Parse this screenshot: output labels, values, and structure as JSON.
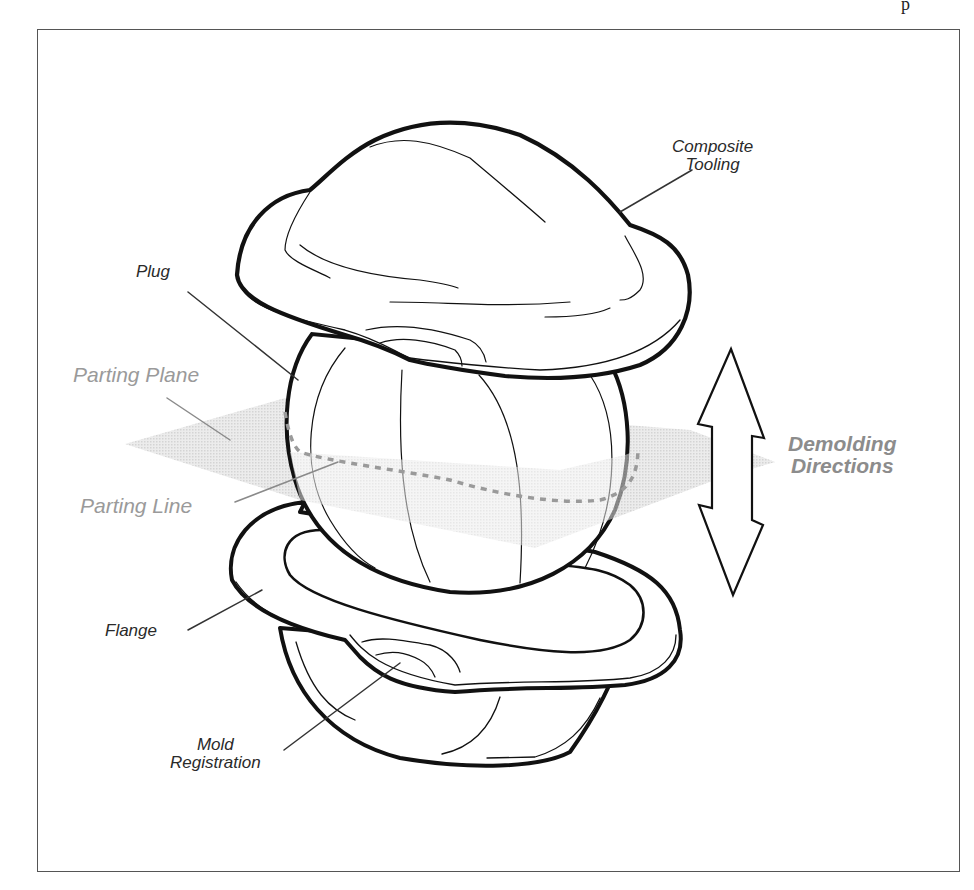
{
  "diagram": {
    "type": "technical illustration",
    "frame": {
      "border_color": "#555555",
      "background": "#ffffff"
    },
    "colors": {
      "outline": "#111111",
      "label_dark": "#2a2a2a",
      "label_gray": "#9a9a9a",
      "parting_plane_fill": "#e2e2e2",
      "parting_line": "#9a9a9a"
    },
    "top_clip_glyph": "p",
    "labels": {
      "composite_tooling": {
        "line1": "Composite",
        "line2": "Tooling"
      },
      "plug": "Plug",
      "parting_plane": "Parting Plane",
      "parting_line": "Parting Line",
      "demolding_directions": {
        "line1": "Demolding",
        "line2": "Directions"
      },
      "flange": "Flange",
      "mold_registration": {
        "line1": "Mold",
        "line2": "Registration"
      }
    },
    "components": [
      {
        "name": "Composite Tooling",
        "position": "top"
      },
      {
        "name": "Plug",
        "position": "middle"
      },
      {
        "name": "Parting Plane",
        "position": "horizontal through plug"
      },
      {
        "name": "Parting Line",
        "position": "dashed equator on plug"
      },
      {
        "name": "Flange",
        "position": "bottom mold rim"
      },
      {
        "name": "Mold Registration",
        "position": "notch on flange"
      },
      {
        "name": "Demolding Directions",
        "position": "double arrow right"
      }
    ]
  }
}
